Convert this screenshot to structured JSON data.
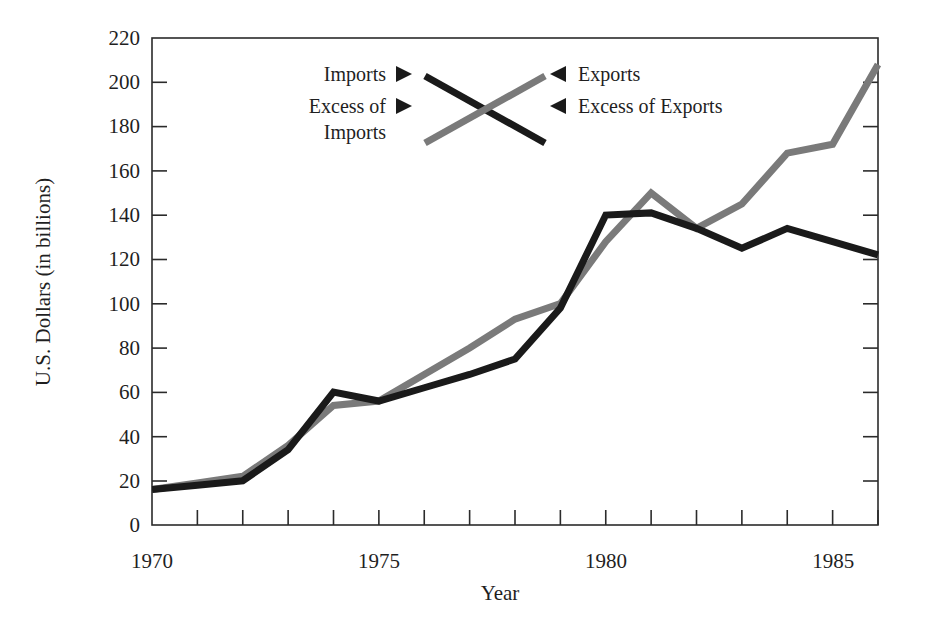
{
  "chart_data": {
    "type": "line",
    "title": "",
    "subtitle": "",
    "xlabel": "Year",
    "ylabel": "U.S. Dollars (in billions)",
    "xlim": [
      1970,
      1986
    ],
    "ylim": [
      0,
      220
    ],
    "y_ticks": [
      0,
      20,
      40,
      60,
      80,
      100,
      120,
      140,
      160,
      180,
      200,
      220
    ],
    "y_tick_labels": [
      "0",
      "20",
      "40",
      "60",
      "80",
      "100",
      "120",
      "140",
      "160",
      "180",
      "200",
      "220"
    ],
    "x_ticks": [
      1970,
      1971,
      1972,
      1973,
      1974,
      1975,
      1976,
      1977,
      1978,
      1979,
      1980,
      1981,
      1982,
      1983,
      1984,
      1985,
      1986
    ],
    "x_tick_labels": [
      "1970",
      "",
      "",
      "",
      "",
      "1975",
      "",
      "",
      "",
      "",
      "1980",
      "",
      "",
      "",
      "",
      "1985",
      ""
    ],
    "x_labeled_ticks": [
      {
        "value": 1970,
        "label": "1970"
      },
      {
        "value": 1975,
        "label": "1975"
      },
      {
        "value": 1980,
        "label": "1980"
      },
      {
        "value": 1985,
        "label": "1985"
      }
    ],
    "grid": false,
    "legend_position": "upper-center",
    "x": [
      1970,
      1971,
      1972,
      1973,
      1974,
      1975,
      1976,
      1977,
      1978,
      1979,
      1980,
      1981,
      1982,
      1983,
      1984,
      1985,
      1986
    ],
    "series": [
      {
        "name": "Imports",
        "color": "#1a1a1a",
        "values": [
          16,
          18,
          20,
          34,
          60,
          56,
          62,
          68,
          75,
          98,
          140,
          141,
          134,
          125,
          134,
          128,
          122
        ]
      },
      {
        "name": "Exports",
        "color": "#7a7a7a",
        "values": [
          16,
          19,
          22,
          36,
          54,
          56,
          68,
          80,
          93,
          100,
          128,
          150,
          134,
          145,
          168,
          172,
          208
        ]
      }
    ]
  },
  "legend": {
    "left_entries": [
      {
        "label": "Imports",
        "marker": "triangle-right-icon",
        "color": "#1a1a1a"
      },
      {
        "label": "Excess of\nImports",
        "line1": "Excess of",
        "line2": "Imports",
        "marker": "triangle-right-icon",
        "color": "#1a1a1a"
      }
    ],
    "right_entries": [
      {
        "label": "Exports",
        "marker": "triangle-left-icon",
        "color": "#7a7a7a"
      },
      {
        "label": "Excess of Exports",
        "marker": "triangle-left-icon",
        "color": "#7a7a7a"
      }
    ],
    "imports_label": "Imports",
    "exports_label": "Exports",
    "excess_of_imports_line1": "Excess of",
    "excess_of_imports_line2": "Imports",
    "excess_of_exports_label": "Excess of Exports"
  },
  "axes": {
    "y_title": "U.S. Dollars (in billions)",
    "x_title": "Year",
    "y_labels": [
      "220",
      "200",
      "180",
      "160",
      "140",
      "120",
      "100",
      "80",
      "60",
      "40",
      "20",
      "0"
    ],
    "x_labels": [
      "1970",
      "1975",
      "1980",
      "1985"
    ]
  },
  "colors": {
    "imports_line": "#1a1a1a",
    "exports_line": "#7a7a7a",
    "axis": "#2b2b2b",
    "text": "#1f1f1f",
    "background": "#ffffff"
  }
}
